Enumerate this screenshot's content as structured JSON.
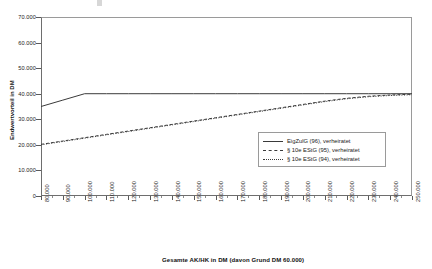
{
  "chart_data": {
    "type": "line",
    "title": "",
    "xlabel": "Gesamte AK/HK in DM (davon Grund DM 60.000)",
    "ylabel": "Endwertvorteil in DM",
    "xlim": [
      80000,
      250000
    ],
    "ylim": [
      0,
      70000
    ],
    "grid": false,
    "legend_position": "inside-right",
    "x_tick_labels": [
      "80.000",
      "90.000",
      "100.000",
      "110.000",
      "120.000",
      "130.000",
      "140.000",
      "150.000",
      "160.000",
      "170.000",
      "180.000",
      "190.000",
      "200.000",
      "210.000",
      "220.000",
      "230.000",
      "240.000",
      "250.000"
    ],
    "y_tick_labels": [
      "0",
      "10.000",
      "20.000",
      "30.000",
      "40.000",
      "50.000",
      "60.000",
      "70.000"
    ],
    "y_ticks": [
      0,
      10000,
      20000,
      30000,
      40000,
      50000,
      60000,
      70000
    ],
    "x": [
      80000,
      90000,
      100000,
      110000,
      120000,
      130000,
      140000,
      150000,
      160000,
      170000,
      180000,
      190000,
      200000,
      210000,
      220000,
      230000,
      240000,
      250000
    ],
    "series": [
      {
        "name": "EigZulG (96), verheiratet",
        "style": "solid",
        "color": "#3a3a3a",
        "values": [
          35000,
          37500,
          40000,
          40000,
          40000,
          40000,
          40000,
          40000,
          40000,
          40000,
          40000,
          40000,
          40000,
          40000,
          40000,
          40000,
          40000,
          40000
        ]
      },
      {
        "name": "§ 10e EStG (95), verheiratet",
        "style": "dashed",
        "color": "#3a3a3a",
        "values": [
          20200,
          21500,
          22800,
          24100,
          25400,
          26700,
          28000,
          29300,
          30600,
          31900,
          33200,
          34500,
          35800,
          37100,
          38200,
          39000,
          39500,
          39800
        ]
      },
      {
        "name": "§ 10e EStG (94), verheiratet",
        "style": "dotted",
        "color": "#3a3a3a",
        "values": [
          20000,
          21300,
          22600,
          23900,
          25200,
          26500,
          27800,
          29100,
          30400,
          31700,
          33000,
          34300,
          35600,
          36900,
          38000,
          38800,
          39300,
          39600
        ]
      }
    ]
  },
  "legend": {
    "entries": [
      {
        "label": "EigZulG (96), verheiratet",
        "style": "solid"
      },
      {
        "label": "§ 10e EStG (95), verheiratet",
        "style": "dashed"
      },
      {
        "label": "§ 10e EStG (94), verheiratet",
        "style": "dotted"
      }
    ]
  },
  "axes": {
    "y_title": "Endwertvorteil in DM",
    "x_title": "Gesamte AK/HK in DM (davon Grund DM 60.000)"
  }
}
